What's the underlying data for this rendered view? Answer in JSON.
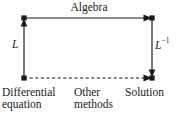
{
  "diagram": {
    "type": "commutative-diagram",
    "nodes": [
      {
        "id": "differential-equation",
        "label": "Differential",
        "label_line2": "equation",
        "x": 24,
        "y": 78,
        "corner": "bottom-left"
      },
      {
        "id": "other-methods",
        "label": "Other",
        "label_line2": "methods",
        "x": 89,
        "y": 78,
        "corner": "bottom-center"
      },
      {
        "id": "solution",
        "label": "Solution",
        "label_line2": "",
        "x": 152,
        "y": 78,
        "corner": "bottom-right"
      },
      {
        "id": "transform-domain-left",
        "label": "",
        "label_line2": "",
        "x": 24,
        "y": 18,
        "corner": "top-left"
      },
      {
        "id": "transform-domain-right",
        "label": "",
        "label_line2": "",
        "x": 152,
        "y": 18,
        "corner": "top-right"
      }
    ],
    "edges": [
      {
        "id": "edge-algebra",
        "label": "Algebra",
        "from": "top-left",
        "to": "top-right",
        "style": "solid",
        "arrow": "right"
      },
      {
        "id": "edge-L",
        "label": "L",
        "superscript": "",
        "from": "bottom-left",
        "to": "top-left",
        "style": "solid",
        "arrow": "up"
      },
      {
        "id": "edge-L-inverse",
        "label": "L",
        "superscript": "−1",
        "from": "top-right",
        "to": "bottom-right",
        "style": "solid",
        "arrow": "down"
      },
      {
        "id": "edge-other-methods",
        "label": "Other methods",
        "from": "bottom-left",
        "to": "bottom-right",
        "style": "dashed",
        "arrow": "right"
      }
    ],
    "labels": {
      "algebra": "Algebra",
      "transform": "L",
      "inverse_transform_base": "L",
      "inverse_transform_exponent": "−1",
      "differential_equation_line1": "Differential",
      "differential_equation_line2": "equation",
      "other_methods_line1": "Other",
      "other_methods_line2": "methods",
      "solution": "Solution"
    },
    "colors": {
      "stroke": "#1a1a1a",
      "text": "#1a1a1a",
      "background": "#ffffff"
    }
  }
}
